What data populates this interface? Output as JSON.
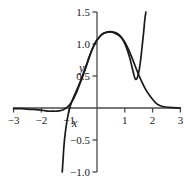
{
  "chart_data": {
    "type": "line",
    "title": "",
    "subtitle": "",
    "xlabel": "x",
    "ylabel": "y",
    "xlim": [
      -3,
      3
    ],
    "ylim": [
      -1.0,
      1.5
    ],
    "grid": false,
    "legend": "none",
    "axis_color": "#4a4a4a",
    "curve_color": "#1a1a1a",
    "background": "#ffffff",
    "xticks": [
      {
        "value": -3,
        "label": "−3"
      },
      {
        "value": -2,
        "label": "−2"
      },
      {
        "value": -1,
        "label": "−1"
      },
      {
        "value": 1,
        "label": "1"
      },
      {
        "value": 2,
        "label": "2"
      },
      {
        "value": 3,
        "label": "3"
      }
    ],
    "yticks": [
      {
        "value": 1.5,
        "label": "1.5"
      },
      {
        "value": 1.0,
        "label": "1.0"
      },
      {
        "value": 0.5,
        "label": "0.5"
      },
      {
        "value": -0.5,
        "label": "−0.5"
      },
      {
        "value": -1.0,
        "label": "−1.0"
      }
    ],
    "series": [
      {
        "name": "bell-curve",
        "description": "smooth bell shaped curve peaking near x=0.55 at y=1.19, flat near zero outside [-2, 2.3]",
        "points": [
          [
            -3.0,
            -0.01
          ],
          [
            -2.7,
            -0.01
          ],
          [
            -2.4,
            -0.02
          ],
          [
            -2.1,
            -0.03
          ],
          [
            -1.9,
            -0.04
          ],
          [
            -1.75,
            -0.05
          ],
          [
            -1.6,
            -0.05
          ],
          [
            -1.45,
            -0.05
          ],
          [
            -1.3,
            -0.04
          ],
          [
            -1.15,
            -0.01
          ],
          [
            -1.05,
            0.02
          ],
          [
            -0.95,
            0.07
          ],
          [
            -0.85,
            0.14
          ],
          [
            -0.75,
            0.23
          ],
          [
            -0.65,
            0.34
          ],
          [
            -0.55,
            0.45
          ],
          [
            -0.45,
            0.57
          ],
          [
            -0.35,
            0.7
          ],
          [
            -0.25,
            0.83
          ],
          [
            -0.15,
            0.94
          ],
          [
            -0.05,
            1.03
          ],
          [
            0.05,
            1.09
          ],
          [
            0.15,
            1.14
          ],
          [
            0.25,
            1.17
          ],
          [
            0.4,
            1.19
          ],
          [
            0.55,
            1.19
          ],
          [
            0.7,
            1.17
          ],
          [
            0.85,
            1.12
          ],
          [
            1.0,
            1.03
          ],
          [
            1.15,
            0.9
          ],
          [
            1.3,
            0.74
          ],
          [
            1.45,
            0.57
          ],
          [
            1.6,
            0.42
          ],
          [
            1.75,
            0.29
          ],
          [
            1.9,
            0.19
          ],
          [
            2.05,
            0.11
          ],
          [
            2.2,
            0.05
          ],
          [
            2.4,
            0.02
          ],
          [
            2.6,
            0.01
          ],
          [
            3.0,
            0.0
          ]
        ]
      },
      {
        "name": "cubic-curve",
        "description": "steep curve entering at y=-1.0 near x=-1.2, crossing zero near x=-1, rising with the bell, local minimum near (1.37, 0.46), then rising steeply past y=1.5 at x=1.75",
        "points": [
          [
            -1.25,
            -1.0
          ],
          [
            -1.22,
            -0.8
          ],
          [
            -1.19,
            -0.6
          ],
          [
            -1.15,
            -0.42
          ],
          [
            -1.1,
            -0.26
          ],
          [
            -1.05,
            -0.13
          ],
          [
            -1.0,
            -0.03
          ],
          [
            -0.94,
            0.06
          ],
          [
            -0.86,
            0.15
          ],
          [
            -0.76,
            0.25
          ],
          [
            -0.66,
            0.35
          ],
          [
            -0.56,
            0.46
          ],
          [
            -0.46,
            0.58
          ],
          [
            -0.36,
            0.7
          ],
          [
            -0.26,
            0.82
          ],
          [
            -0.16,
            0.93
          ],
          [
            -0.06,
            1.02
          ],
          [
            0.05,
            1.09
          ],
          [
            0.18,
            1.15
          ],
          [
            0.32,
            1.18
          ],
          [
            0.48,
            1.19
          ],
          [
            0.64,
            1.17
          ],
          [
            0.8,
            1.13
          ],
          [
            0.95,
            1.05
          ],
          [
            1.08,
            0.92
          ],
          [
            1.18,
            0.78
          ],
          [
            1.26,
            0.64
          ],
          [
            1.32,
            0.53
          ],
          [
            1.37,
            0.46
          ],
          [
            1.42,
            0.45
          ],
          [
            1.47,
            0.5
          ],
          [
            1.52,
            0.6
          ],
          [
            1.57,
            0.75
          ],
          [
            1.62,
            0.95
          ],
          [
            1.67,
            1.15
          ],
          [
            1.72,
            1.38
          ],
          [
            1.76,
            1.5
          ]
        ]
      }
    ]
  },
  "labels": {
    "y_axis_name": "y",
    "x_axis_name": "x"
  }
}
